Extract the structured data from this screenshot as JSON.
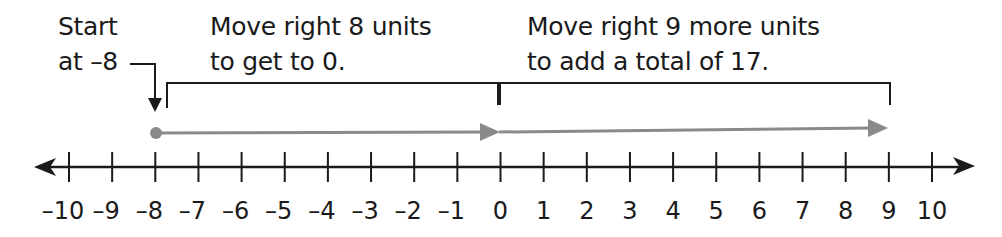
{
  "annotations": {
    "start": {
      "line1": "Start",
      "line2": "at –8"
    },
    "step1": {
      "line1": "Move right 8 units",
      "line2": "to get to 0."
    },
    "step2": {
      "line1": "Move right 9 more units",
      "line2": "to add a total of 17."
    }
  },
  "number_line": {
    "min": -10,
    "max": 10,
    "ticks": [
      "–10",
      "–9",
      "–8",
      "–7",
      "–6",
      "–5",
      "–4",
      "–3",
      "–2",
      "–1",
      "0",
      "1",
      "2",
      "3",
      "4",
      "5",
      "6",
      "7",
      "8",
      "9",
      "10"
    ]
  },
  "jumps": [
    {
      "from": -8,
      "to": 0,
      "units": 8
    },
    {
      "from": 0,
      "to": 9,
      "units": 9
    }
  ],
  "colors": {
    "ink": "#1a1a1a",
    "jump_arrow": "#8a8a8a"
  }
}
